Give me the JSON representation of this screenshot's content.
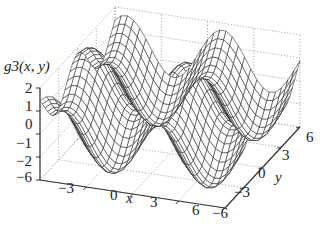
{
  "chart_data": {
    "type": "surface",
    "title": "",
    "zlabel": "g3(x, y)",
    "xlabel": "x",
    "ylabel": "y",
    "xlim": [
      -6,
      6
    ],
    "ylim": [
      -6,
      6
    ],
    "zlim": [
      -2,
      2
    ],
    "xticks": [
      "-3",
      "0",
      "3",
      "6"
    ],
    "yticks": [
      "-6",
      "-3",
      "0",
      "3",
      "6"
    ],
    "zticks": [
      "2",
      "1",
      "0",
      "-1",
      "-2"
    ],
    "corner_tick": "-6",
    "grid": true,
    "style": "wireframe mesh, black lines, dotted gray grid box",
    "surface": "oscillating wave surface with ~2 periods along x and y, amplitude ~2"
  },
  "labels": {
    "zaxis": "g3(x, y)",
    "x": "x",
    "y": "y",
    "z2": "2",
    "z1": "1",
    "z0": "0",
    "zm1": "−1",
    "zm2": "−2",
    "xm6": "−6",
    "xm3": "−3",
    "x0": "0",
    "x3": "3",
    "x6": "6",
    "ym6": "−6",
    "ym3": "−3",
    "y0": "0",
    "y3": "3",
    "y6": "6"
  }
}
